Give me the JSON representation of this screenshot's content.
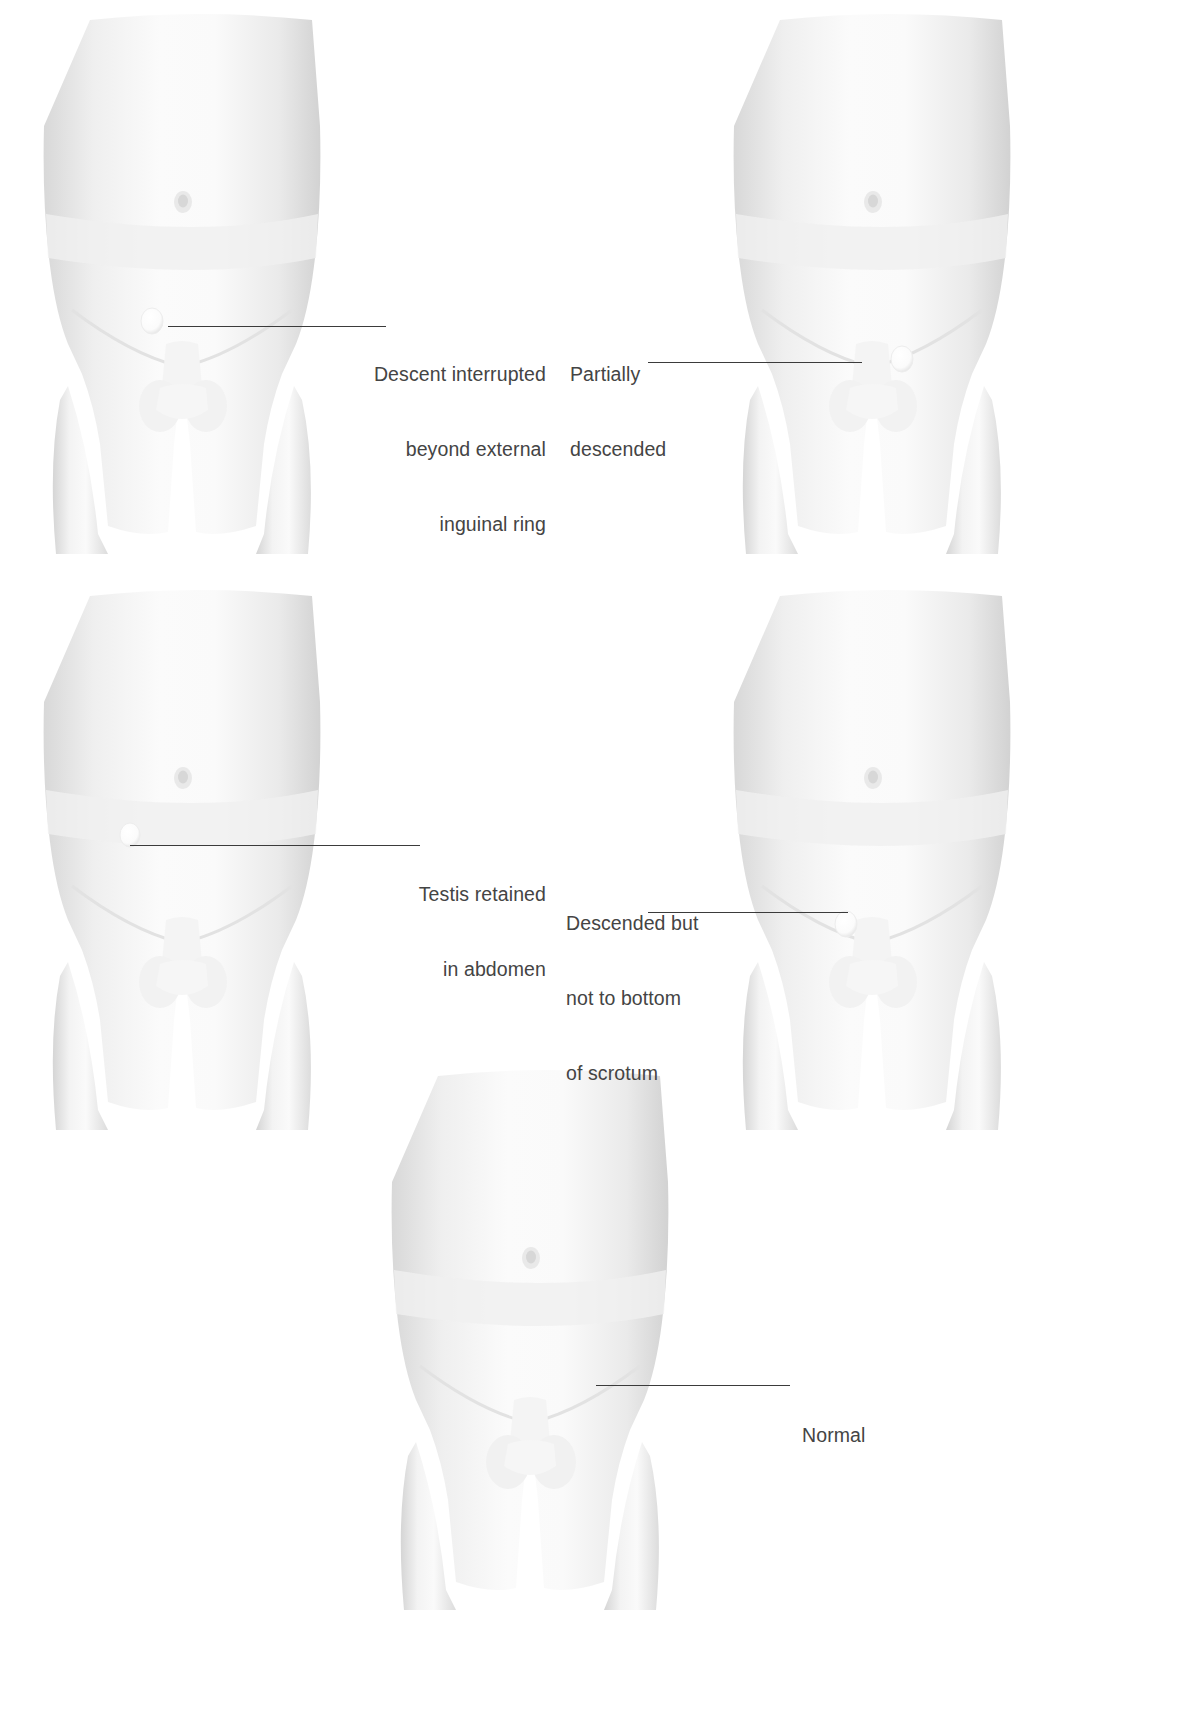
{
  "document": {
    "type": "medical-illustration",
    "subject": "Testicular descent variations",
    "background_color": "#ffffff",
    "label_color": "#444444",
    "leader_line_color": "#3b3b3b"
  },
  "figures": [
    {
      "id": "figure-top-left",
      "name": "descent-interrupted-figure",
      "marker": "testis-marker",
      "marker_description": "small pale ovoid near external inguinal ring"
    },
    {
      "id": "figure-top-right",
      "name": "partially-descended-figure",
      "marker": "testis-marker",
      "marker_description": "small pale ovoid at upper scrotum"
    },
    {
      "id": "figure-middle-left",
      "name": "testis-retained-abdomen-figure",
      "marker": "testis-marker",
      "marker_description": "small pale ovoid within lower abdomen"
    },
    {
      "id": "figure-middle-right",
      "name": "descended-not-to-bottom-figure",
      "marker": "testis-marker",
      "marker_description": "small pale ovoid in mid scrotum"
    },
    {
      "id": "figure-bottom-center",
      "name": "normal-figure",
      "marker": "testis-marker",
      "marker_description": "testis at bottom of scrotum"
    }
  ],
  "labels": [
    {
      "id": "label-descent-interrupted",
      "name": "label-descent-interrupted",
      "align": "right",
      "lines": [
        "Descent interrupted",
        "beyond external",
        "inguinal ring"
      ],
      "text": "Descent interrupted beyond external inguinal ring"
    },
    {
      "id": "label-partially-descended",
      "name": "label-partially-descended",
      "align": "left",
      "lines": [
        "Partially",
        "descended"
      ],
      "text": "Partially descended"
    },
    {
      "id": "label-testis-retained",
      "name": "label-testis-retained-in-abdomen",
      "align": "right",
      "lines": [
        "Testis retained",
        "in abdomen"
      ],
      "text": "Testis retained in abdomen"
    },
    {
      "id": "label-descended-not-bottom",
      "name": "label-descended-but-not-to-bottom-of-scrotum",
      "align": "left",
      "lines": [
        "Descended but",
        "not to bottom",
        "of scrotum"
      ],
      "text": "Descended but not to bottom of scrotum"
    },
    {
      "id": "label-normal",
      "name": "label-normal",
      "align": "left",
      "lines": [
        "Normal"
      ],
      "text": "Normal"
    }
  ]
}
